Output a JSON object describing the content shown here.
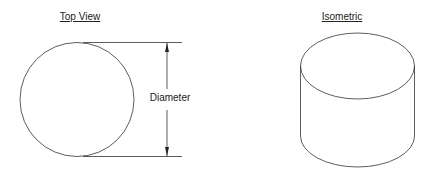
{
  "top_view": {
    "title": "Top View",
    "dimension_label": "Diameter"
  },
  "isometric": {
    "title": "Isometric"
  },
  "colors": {
    "line": "#333333",
    "text": "#222222"
  }
}
